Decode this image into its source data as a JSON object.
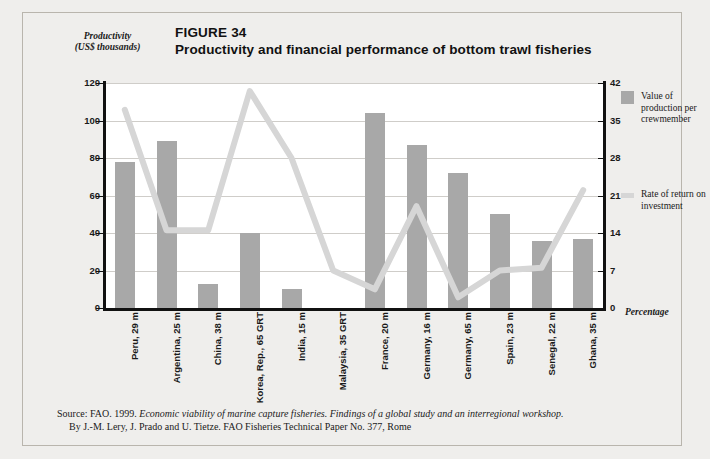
{
  "figure": {
    "number": "FIGURE 34",
    "title": "Productivity and financial performance of bottom trawl fisheries"
  },
  "axis": {
    "left_label_line1": "Productivity",
    "left_label_line2": "(US$ thousands)",
    "right_label": "Percentage"
  },
  "legend": {
    "bar_label": "Value of production per crewmember",
    "line_label": "Rate of return on investment",
    "bar_color": "#a8a8a8",
    "line_color": "#d6d6d6"
  },
  "source": {
    "line1_prefix": "Source: FAO. 1999. ",
    "line1_italic": "Economic viability of marine capture fisheries. Findings of a global study and an interregional workshop.",
    "line2": "By J.-M. Lery, J. Prado and U. Tietze. FAO Fisheries Technical Paper No. 377, Rome"
  },
  "chart_data": {
    "type": "bar",
    "title": "Productivity and financial performance of bottom trawl fisheries",
    "xlabel": "",
    "ylabel": "Productivity (US$ thousands)",
    "y2label": "Percentage",
    "ylim": [
      0,
      120
    ],
    "y2lim": [
      0,
      42
    ],
    "yticks": [
      0,
      20,
      40,
      60,
      80,
      100,
      120
    ],
    "y2ticks": [
      0,
      7,
      14,
      21,
      28,
      35,
      42
    ],
    "grid": true,
    "legend_position": "right",
    "categories": [
      "Peru, 29 m",
      "Argentina, 25 m",
      "China, 38 m",
      "Korea, Rep., 65 GRT",
      "India, 15 m",
      "Malaysia, 35 GRT",
      "France, 20 m",
      "Germany, 16 m",
      "Germany, 65 m",
      "Spain, 23 m",
      "Senegal, 22 m",
      "Ghana, 35 m"
    ],
    "series": [
      {
        "name": "Value of production per crewmember",
        "type": "bar",
        "axis": "left",
        "values": [
          78,
          89,
          13,
          40,
          10,
          0,
          104,
          87,
          72,
          50,
          36,
          37
        ]
      },
      {
        "name": "Rate of return on investment",
        "type": "line",
        "axis": "right",
        "values": [
          37,
          14.5,
          14.5,
          40.5,
          28,
          7,
          3.5,
          19,
          2,
          7,
          7.5,
          22
        ]
      }
    ]
  }
}
